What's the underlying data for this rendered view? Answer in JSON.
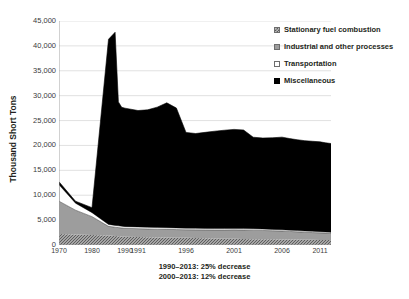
{
  "chart_data": {
    "type": "area",
    "stacked": true,
    "title": "",
    "subtitle": "",
    "xlabel": "",
    "ylabel": "Thousand Short Tons",
    "ylim": [
      0,
      45000
    ],
    "ytick_labels": [
      "45,000",
      "40,000",
      "35,000",
      "30,000",
      "25,000",
      "20,000",
      "15,000",
      "10,000",
      "5,000",
      "0"
    ],
    "ytick_values": [
      45000,
      40000,
      35000,
      30000,
      25000,
      20000,
      15000,
      10000,
      5000,
      0
    ],
    "xtick_labels": [
      "1970",
      "1980",
      "1990",
      "1991",
      "1996",
      "2001",
      "2006",
      "2011"
    ],
    "xtick_values": [
      1970,
      1980,
      1990,
      1991,
      1996,
      2001,
      2006,
      2011
    ],
    "grid": "horizontal",
    "legend_position": "top-right",
    "x": [
      1970,
      1975,
      1980,
      1985,
      1987,
      1988,
      1989,
      1990,
      1991,
      1992,
      1993,
      1994,
      1995,
      1996,
      1997,
      1998,
      1999,
      2000,
      2001,
      2002,
      2003,
      2004,
      2005,
      2006,
      2007,
      2008,
      2009,
      2010,
      2011,
      2012,
      2013
    ],
    "series": [
      {
        "name": "Stationary fuel combustion",
        "key": "hatch",
        "color": "#b9b9b9",
        "values": [
          2200,
          2100,
          2000,
          1900,
          1800,
          1750,
          1700,
          1650,
          1600,
          1560,
          1520,
          1500,
          1470,
          1440,
          1400,
          1350,
          1300,
          1260,
          1240,
          1200,
          1180,
          1160,
          1150,
          1130,
          1110,
          1090,
          1060,
          1040,
          1020,
          1000,
          980
        ]
      },
      {
        "name": "Industrial and other processes",
        "key": "gray",
        "color": "#9d9d9d",
        "values": [
          6600,
          4900,
          3700,
          1850,
          1780,
          1750,
          1720,
          1700,
          1680,
          1660,
          1650,
          1640,
          1630,
          1620,
          1640,
          1680,
          1720,
          1760,
          1800,
          1820,
          1800,
          1760,
          1720,
          1680,
          1620,
          1560,
          1500,
          1460,
          1420,
          1400,
          1380
        ]
      },
      {
        "name": "Transportation",
        "key": "white",
        "color": "#ffffff",
        "values": [
          3300,
          1400,
          800,
          380,
          360,
          350,
          345,
          340,
          335,
          330,
          325,
          320,
          315,
          310,
          305,
          300,
          295,
          290,
          285,
          280,
          275,
          270,
          265,
          260,
          255,
          250,
          245,
          240,
          235,
          230,
          225
        ]
      },
      {
        "name": "Miscellaneous",
        "key": "black",
        "color": "#000000",
        "values": [
          600,
          400,
          1000,
          37200,
          38800,
          24900,
          23900,
          23800,
          23400,
          23600,
          24200,
          25100,
          24100,
          19250,
          19050,
          19300,
          19550,
          19750,
          19900,
          19800,
          18400,
          18300,
          18400,
          18600,
          18400,
          18250,
          18150,
          18100,
          18050,
          17900,
          17800
        ]
      }
    ],
    "series_totals": [
      12700,
      8800,
      7500,
      41330,
      42740,
      28750,
      27665,
      27490,
      27015,
      27150,
      27695,
      28560,
      27515,
      22620,
      22395,
      22630,
      22865,
      23060,
      23225,
      23100,
      21655,
      21490,
      21535,
      21670,
      21385,
      21150,
      20955,
      20840,
      20725,
      20530,
      20385
    ],
    "annotations": [
      "1990–2013: 25% decrease",
      "2000–2013: 12% decrease"
    ]
  },
  "axes": {
    "y_title": "Thousand Short Tons"
  },
  "legend": {
    "items": [
      {
        "label": "Stationary fuel combustion",
        "key": "hatch"
      },
      {
        "label": "Industrial and other processes",
        "key": "gray"
      },
      {
        "label": "Transportation",
        "key": "white"
      },
      {
        "label": "Miscellaneous",
        "key": "black"
      }
    ]
  },
  "notes": {
    "line1": "1990–2013: 25% decrease",
    "line2": "2000–2013: 12% decrease"
  },
  "footer": {
    "cut_text": ""
  },
  "colors": {
    "hatch_base": "#b9b9b9",
    "hatch_line": "#5d5d5d",
    "gray": "#9d9d9d",
    "white": "#ffffff",
    "black": "#000000",
    "grid": "#d4d4d4",
    "axis": "#9a9a9a",
    "text": "#231f20"
  }
}
